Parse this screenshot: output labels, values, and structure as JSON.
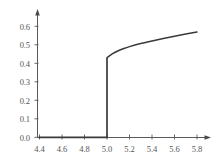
{
  "chart_data": {
    "type": "line",
    "title": "",
    "subtitle": "",
    "xlabel": "",
    "ylabel": "",
    "xlim": [
      4.4,
      5.85
    ],
    "ylim": [
      0.0,
      0.65
    ],
    "grid": false,
    "legend": null,
    "annotations": [],
    "xticks": [
      "4.4",
      "4.6",
      "4.8",
      "5.0",
      "5.2",
      "5.4",
      "5.6",
      "5.8"
    ],
    "xtick_values": [
      4.4,
      4.6,
      4.8,
      5.0,
      5.2,
      5.4,
      5.6,
      5.8
    ],
    "yticks": [
      "0.0",
      "0.1",
      "0.2",
      "0.3",
      "0.4",
      "0.5",
      "0.6"
    ],
    "ytick_values": [
      0.0,
      0.1,
      0.2,
      0.3,
      0.4,
      0.5,
      0.6
    ],
    "line_color": "#3a3a3a",
    "axis_color": "#5a5a5a",
    "background_color": "#ffffff",
    "series": [
      {
        "name": "lower-branch",
        "description": "flat zero branch before the jump",
        "x": [
          4.4,
          4.5,
          4.6,
          4.7,
          4.8,
          4.9,
          5.0
        ],
        "values": [
          0.0,
          0.0,
          0.0,
          0.0,
          0.0,
          0.0,
          0.0
        ]
      },
      {
        "name": "jump",
        "description": "vertical discontinuity at x = 5.0",
        "x": [
          5.0,
          5.0
        ],
        "values": [
          0.0,
          0.43
        ]
      },
      {
        "name": "upper-branch",
        "description": "square-root-like rise after the jump",
        "x": [
          5.0,
          5.05,
          5.1,
          5.15,
          5.2,
          5.3,
          5.4,
          5.5,
          5.6,
          5.7,
          5.8
        ],
        "values": [
          0.43,
          0.452,
          0.468,
          0.48,
          0.49,
          0.507,
          0.521,
          0.534,
          0.546,
          0.558,
          0.569
        ]
      }
    ]
  }
}
